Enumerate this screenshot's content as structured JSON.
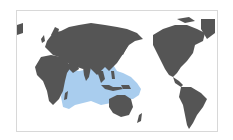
{
  "map": {
    "type": "world-distribution-map",
    "projection": "pacific-centered",
    "colors": {
      "land": "#555555",
      "range": "#a9cdee",
      "ocean": "#ffffff",
      "frame": "#d8d8d8"
    },
    "range_region": "Indo-Pacific (Red Sea and East Africa to Japan, Australia and the western Pacific)"
  }
}
